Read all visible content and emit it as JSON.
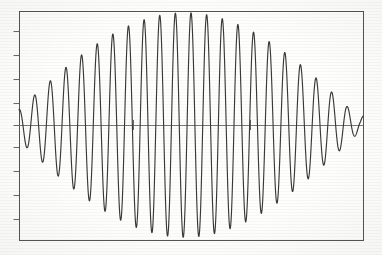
{
  "figure": {
    "kind": "line-plot",
    "title": "",
    "caption": "",
    "background_color": "#fefefd",
    "frame": {
      "x": 19,
      "y": 11,
      "width": 344,
      "height": 229,
      "stroke": "#55544f",
      "stroke_width": 1.0
    },
    "zero_line": {
      "y": 125,
      "stroke": "#6d6c68",
      "stroke_width": 0.9
    },
    "curve": {
      "stroke": "#3a3935",
      "stroke_width": 1.15
    },
    "axis_ticks": {
      "left_y_values": [
        31,
        55,
        79,
        103,
        125,
        147,
        171,
        195,
        219
      ],
      "left_tick_length": 6,
      "inline_x_values": [
        133,
        250
      ],
      "inline_tick_half_height": 5,
      "stroke": "#5a5954"
    }
  },
  "chart_data": {
    "type": "line",
    "xlabel": "",
    "ylabel": "",
    "xlim": [
      0,
      1
    ],
    "ylim": [
      -1.12,
      1.12
    ],
    "grid": false,
    "legend": "none",
    "annotations": [
      "amplitude envelope forms a beat node near the centre",
      "left and right lobes reach full amplitude at the plot edges",
      "two small tick marks sit on the zero line"
    ],
    "tick_labels": {
      "x": [],
      "y": []
    },
    "model": {
      "description": "y = cos(2*pi*f_carrier*x + phase) * cos(pi*(x - node_x)/node_period)",
      "carrier_cycles": 22.0,
      "carrier_phase_deg": 0,
      "envelope_node_x": 0.482,
      "envelope_half_period_x": 1.02,
      "envelope_residual": 0.055,
      "samples": 1800
    },
    "series": [
      {
        "name": "beat waveform",
        "color": "#3a3935",
        "x_start": 0.0,
        "x_end": 1.0,
        "peaks_x": [
          0.005,
          0.052,
          0.097,
          0.143,
          0.188,
          0.234,
          0.281,
          0.326,
          0.372,
          0.418,
          0.463,
          0.51,
          0.556,
          0.602,
          0.648,
          0.694,
          0.74,
          0.787,
          0.833,
          0.879,
          0.925,
          0.97
        ],
        "peaks_y": [
          0.64,
          0.9,
          1.0,
          0.96,
          0.8,
          0.56,
          0.33,
          0.14,
          0.06,
          0.1,
          0.2,
          0.34,
          0.54,
          0.72,
          0.88,
          0.98,
          1.0,
          0.96,
          0.88,
          0.7,
          0.52,
          0.38
        ]
      }
    ]
  }
}
